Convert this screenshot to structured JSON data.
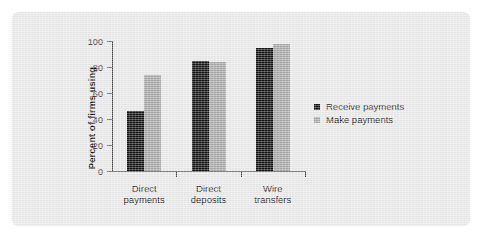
{
  "chart_data": {
    "type": "bar",
    "title": "",
    "subtitle": "",
    "xlabel": "",
    "ylabel": "Percent of firms using",
    "categories": [
      "Direct payments",
      "Direct deposits",
      "Wire transfers"
    ],
    "category_lines": [
      [
        "Direct",
        "payments"
      ],
      [
        "Direct",
        "deposits"
      ],
      [
        "Wire",
        "transfers"
      ]
    ],
    "series": [
      {
        "name": "Receive payments",
        "color": "#111111",
        "values": [
          46,
          85,
          95
        ]
      },
      {
        "name": "Make payments",
        "color": "#a8a8a8",
        "values": [
          74,
          84,
          98
        ]
      }
    ],
    "ylim": [
      0,
      100
    ],
    "ytick_values": [
      0,
      20,
      40,
      60,
      80,
      100
    ],
    "ytick_labels": [
      "0",
      "20",
      "40",
      "60",
      "80",
      "100"
    ],
    "grid": false,
    "legend_position": "right",
    "axis_color": "#4a4a4a",
    "panel_color": "#e9e9e9",
    "page_color": "#ffffff"
  }
}
